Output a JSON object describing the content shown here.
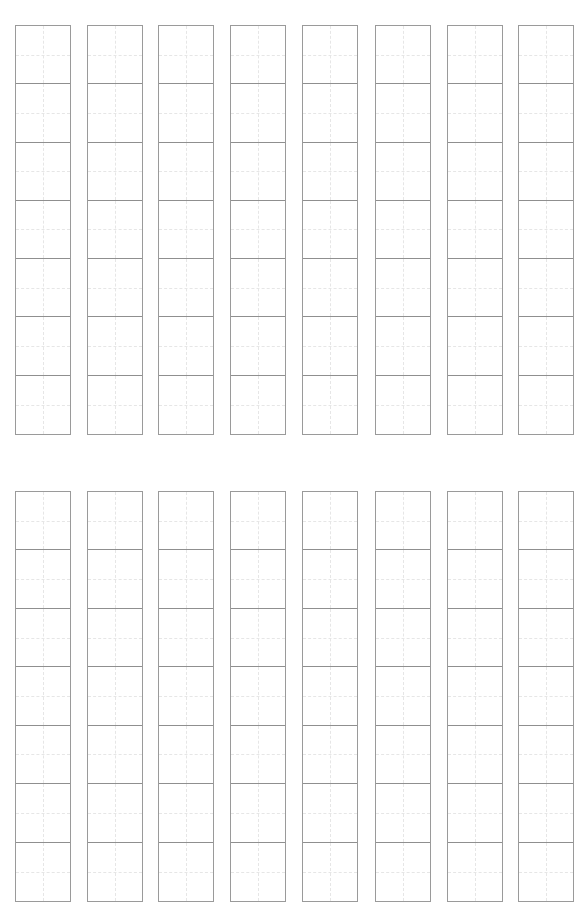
{
  "page": {
    "type": "practice-grid-sheet",
    "background": "#ffffff",
    "line_color": "#9a9a9a",
    "guide_color": "#e6e6e6"
  },
  "blocks": [
    {
      "top": 25,
      "height": 410,
      "columns": 8,
      "cells_per_column": 7
    },
    {
      "top": 491,
      "height": 411,
      "columns": 8,
      "cells_per_column": 7
    }
  ],
  "column_lefts": [
    15,
    87,
    158,
    230,
    302,
    375,
    447,
    518
  ]
}
